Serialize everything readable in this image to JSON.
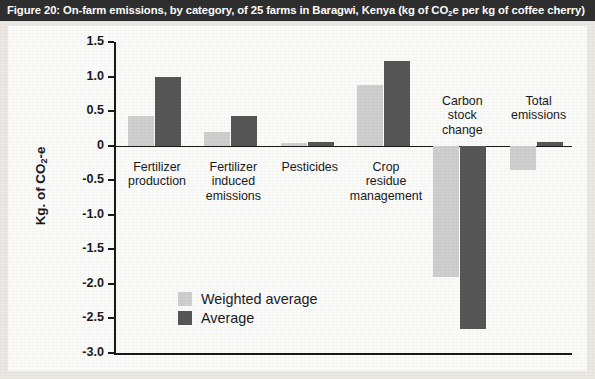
{
  "figure": {
    "title_prefix": "Figure 20: On-farm emissions, by category, of 25 farms in Baragwi, Kenya (kg of CO",
    "title_subscript": "2",
    "title_suffix": "e per kg of coffee cherry)",
    "title_full": "Figure 20: On-farm emissions, by category, of 25 farms in Baragwi, Kenya (kg of CO2e per kg of coffee cherry)"
  },
  "axis": {
    "y_title_prefix": "Kg. of CO",
    "y_title_subscript": "2",
    "y_title_suffix": "-e",
    "y_title_full": "Kg. of CO2-e",
    "y_ticks": [
      "1.5",
      "1.0",
      "0.5",
      "0",
      "-0.5",
      "-1.0",
      "-1.5",
      "-2.0",
      "-2.5",
      "-3.0"
    ]
  },
  "legend": {
    "position": "inside-lower-left",
    "items": [
      {
        "label": "Weighted average",
        "color": "#cfcfcf"
      },
      {
        "label": "Average",
        "color": "#565656"
      }
    ]
  },
  "colors": {
    "weighted_average": "#cfcfcf",
    "average": "#565656",
    "title_bar_bg": "#2f2f2f",
    "title_bar_text": "#ffffff",
    "plot_bg": "#fbfbfa",
    "page_bg": "#ece9e4",
    "axis": "#1a1a1a"
  },
  "chart_data": {
    "type": "bar",
    "title": "Figure 20: On-farm emissions, by category, of 25 farms in Baragwi, Kenya (kg of CO2e per kg of coffee cherry)",
    "xlabel": "",
    "ylabel": "Kg. of CO2-e",
    "ylim": [
      -3.0,
      1.5
    ],
    "ytick_step": 0.5,
    "grid": false,
    "legend_position": "inside-lower-left",
    "categories": [
      "Fertilizer\nproduction",
      "Fertilizer\ninduced\nemissions",
      "Pesticides",
      "Crop\nresidue\nmanagement",
      "Carbon\nstock\nchange",
      "Total\nemissions"
    ],
    "series": [
      {
        "name": "Weighted average",
        "color": "#cfcfcf",
        "values": [
          0.43,
          0.2,
          0.04,
          0.88,
          -1.9,
          -0.35
        ]
      },
      {
        "name": "Average",
        "color": "#565656",
        "values": [
          1.0,
          0.43,
          0.06,
          1.22,
          -2.65,
          0.05
        ]
      }
    ]
  }
}
